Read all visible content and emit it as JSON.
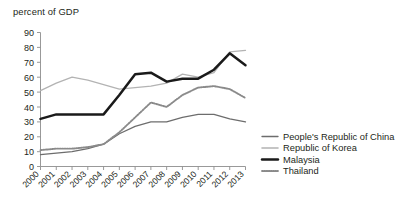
{
  "chart_data": {
    "type": "line",
    "title": "percent of GDP",
    "xlabel": "",
    "ylabel": "",
    "ylim": [
      0,
      90
    ],
    "ytick_labels": [
      "0",
      "10",
      "20",
      "30",
      "40",
      "50",
      "60",
      "70",
      "80",
      "90"
    ],
    "ytick_values": [
      0,
      10,
      20,
      30,
      40,
      50,
      60,
      70,
      80,
      90
    ],
    "grid": false,
    "legend_position": "right",
    "categories": [
      "2000",
      "2001",
      "2002",
      "2003",
      "2004",
      "2005",
      "2006",
      "2007",
      "2008",
      "2009",
      "2010",
      "2011",
      "2012",
      "2013"
    ],
    "x": [
      2000,
      2001,
      2002,
      2003,
      2004,
      2005,
      2006,
      2007,
      2008,
      2009,
      2010,
      2011,
      2012,
      2013
    ],
    "series": [
      {
        "name": "People's Republic of China",
        "color": "#6d6d6d",
        "style": "solid-thin",
        "values": [
          8,
          9,
          10,
          12,
          15,
          22,
          27,
          30,
          30,
          33,
          35,
          35,
          32,
          30
        ]
      },
      {
        "name": "Republic of Korea",
        "color": "#b3b3b3",
        "style": "solid-thin",
        "values": [
          51,
          56,
          60,
          58,
          55,
          52,
          53,
          54,
          56,
          62,
          60,
          63,
          77,
          78
        ]
      },
      {
        "name": "Malaysia",
        "color": "#1a1a1a",
        "style": "solid-bold",
        "values": [
          32,
          35,
          35,
          35,
          35,
          48,
          62,
          63,
          57,
          59,
          59,
          65,
          76,
          68
        ]
      },
      {
        "name": "Thailand",
        "color": "#8a8a8a",
        "style": "dotted",
        "values": [
          11,
          12,
          12,
          13,
          15,
          23,
          33,
          43,
          40,
          48,
          53,
          54,
          52,
          46
        ]
      }
    ]
  },
  "legend": {
    "items": [
      {
        "label": "People's Republic of China"
      },
      {
        "label": "Republic of Korea"
      },
      {
        "label": "Malaysia"
      },
      {
        "label": "Thailand"
      }
    ]
  },
  "colors": {
    "china": "#6d6d6d",
    "korea": "#b3b3b3",
    "malaysia": "#1a1a1a",
    "thailand": "#8a8a8a",
    "axis": "#8d8d8d",
    "text": "#231f20"
  }
}
